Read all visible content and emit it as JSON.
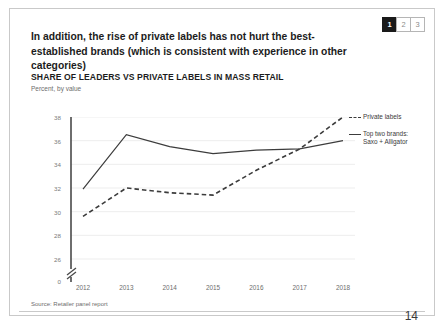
{
  "pager": {
    "pages": [
      {
        "label": "1",
        "active": true
      },
      {
        "label": "2",
        "active": false
      },
      {
        "label": "3",
        "active": false
      }
    ]
  },
  "headline": "In addition, the rise of private labels has not hurt the best-established brands (which is consistent with experience in other categories)",
  "kicker": "SHARE OF LEADERS VS PRIVATE LABELS IN MASS RETAIL",
  "subkicker": "Percent, by value",
  "source": "Source: Retailer panel report",
  "page_number": "14",
  "colors": {
    "line": "#3c3c3c",
    "grid": "#e9e9e9",
    "axis": "#4a4a4a",
    "accent": "#1a1a1a"
  },
  "chart_data": {
    "type": "line",
    "title": "SHARE OF LEADERS VS PRIVATE LABELS IN MASS RETAIL",
    "subtitle": "Percent, by value",
    "xlabel": "",
    "ylabel": "Percent, by value",
    "categories": [
      "2012",
      "2013",
      "2014",
      "2015",
      "2016",
      "2017",
      "2018"
    ],
    "yticks": [
      "38",
      "36",
      "34",
      "32",
      "30",
      "28",
      "26",
      "0"
    ],
    "ylim": [
      26,
      38
    ],
    "axis_break": true,
    "grid": true,
    "legend_position": "right",
    "series": [
      {
        "name": "Top two brands: Saxo + Alligator",
        "legend_label_line1": "Top two brands:",
        "legend_label_line2": "Saxo + Alligator",
        "style": "solid",
        "values": [
          31.9,
          36.5,
          35.5,
          34.9,
          35.2,
          35.3,
          36.0
        ]
      },
      {
        "name": "Private labels",
        "legend_label_line1": "Private labels",
        "legend_label_line2": "",
        "style": "dashed",
        "values": [
          29.6,
          32.0,
          31.6,
          31.4,
          33.5,
          35.3,
          38.0
        ]
      }
    ]
  }
}
